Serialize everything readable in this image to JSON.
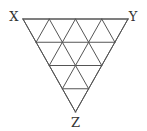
{
  "diagram": {
    "type": "triangular-grid",
    "subdivisions": 4,
    "stroke_color": "#555555",
    "background": "#ffffff",
    "vertices": {
      "X": {
        "label": "X",
        "x": 23,
        "y": 19
      },
      "Y": {
        "label": "Y",
        "x": 128,
        "y": 19
      },
      "Z": {
        "label": "Z",
        "x": 75.5,
        "y": 112
      }
    },
    "labels": [
      {
        "id": "X",
        "text": "X",
        "x": 14,
        "y": 21
      },
      {
        "id": "Y",
        "text": "Y",
        "x": 133,
        "y": 21
      },
      {
        "id": "Z",
        "text": "Z",
        "x": 75.5,
        "y": 127
      }
    ]
  }
}
